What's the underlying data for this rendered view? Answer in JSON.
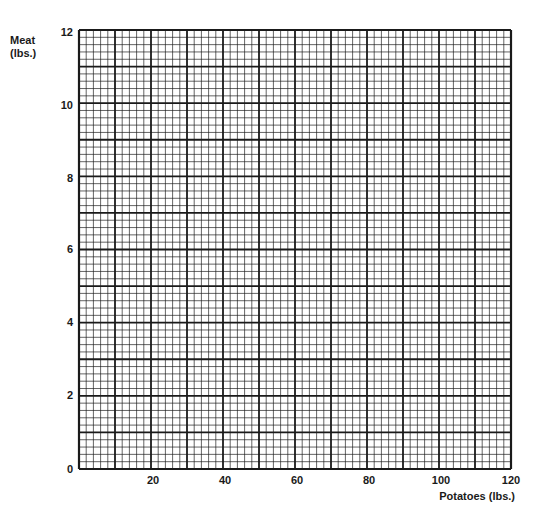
{
  "chart_data": {
    "type": "line",
    "title": "",
    "xlabel": "Potatoes (lbs.)",
    "ylabel_lines": [
      "Meat",
      "(lbs.)"
    ],
    "ylabel": "Meat (lbs.)",
    "xlim": [
      0,
      120
    ],
    "ylim": [
      0,
      12
    ],
    "x_ticks": [
      "20",
      "40",
      "60",
      "80",
      "100",
      "120"
    ],
    "x_tick_values": [
      20,
      40,
      60,
      80,
      100,
      120
    ],
    "y_ticks": [
      "0",
      "2",
      "4",
      "6",
      "8",
      "10",
      "12"
    ],
    "y_tick_values": [
      0,
      2,
      4,
      6,
      8,
      10,
      12
    ],
    "grid": true,
    "grid_major_x_step": 10,
    "grid_major_y_step": 1,
    "grid_minor_subdivisions": 5,
    "series": [],
    "note": "Blank graph paper; no data plotted"
  },
  "colors": {
    "grid_line": "#1a1a1a",
    "background": "#ffffff"
  }
}
